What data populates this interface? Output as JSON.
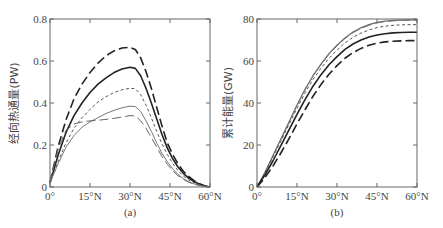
{
  "chart_data": [
    {
      "id": "a",
      "type": "line",
      "caption": "(a)",
      "title": "",
      "xlabel": "",
      "ylabel": "经向热通量(PW)",
      "xlim": [
        0,
        60
      ],
      "ylim": [
        0,
        0.8
      ],
      "xticks": [
        0,
        15,
        30,
        45,
        60
      ],
      "xtick_labels": [
        "0°",
        "15°N",
        "30°N",
        "45°N",
        "60°N"
      ],
      "yticks": [
        0,
        0.2,
        0.4,
        0.6,
        0.8
      ],
      "ytick_labels": [
        "0",
        "0.2",
        "0.4",
        "0.6",
        "0.8"
      ],
      "grid": false,
      "legend": null,
      "x": [
        0,
        3,
        6,
        9,
        12,
        15,
        18,
        21,
        24,
        27,
        30,
        32,
        34,
        36,
        38,
        40,
        42,
        44,
        46,
        48,
        50,
        52,
        54,
        56,
        58,
        60
      ],
      "series": [
        {
          "name": "long-dash (heavy)",
          "style": "long-dash",
          "color": "#222222",
          "width": 1.6,
          "values": [
            0.02,
            0.19,
            0.32,
            0.42,
            0.49,
            0.545,
            0.59,
            0.625,
            0.648,
            0.662,
            0.665,
            0.655,
            0.615,
            0.55,
            0.47,
            0.38,
            0.29,
            0.21,
            0.155,
            0.11,
            0.075,
            0.05,
            0.03,
            0.016,
            0.006,
            0.0
          ]
        },
        {
          "name": "solid (heavy)",
          "style": "solid",
          "color": "#222222",
          "width": 1.6,
          "values": [
            0.02,
            0.15,
            0.26,
            0.34,
            0.4,
            0.45,
            0.49,
            0.52,
            0.545,
            0.562,
            0.57,
            0.565,
            0.53,
            0.47,
            0.4,
            0.325,
            0.25,
            0.185,
            0.135,
            0.095,
            0.065,
            0.042,
            0.026,
            0.014,
            0.005,
            0.0
          ]
        },
        {
          "name": "short-dash",
          "style": "short-dash",
          "color": "#555555",
          "width": 1.0,
          "values": [
            0.02,
            0.12,
            0.21,
            0.28,
            0.33,
            0.37,
            0.405,
            0.43,
            0.45,
            0.463,
            0.47,
            0.468,
            0.44,
            0.39,
            0.33,
            0.265,
            0.205,
            0.155,
            0.112,
            0.078,
            0.052,
            0.034,
            0.02,
            0.011,
            0.004,
            0.0
          ]
        },
        {
          "name": "solid (light)",
          "style": "solid",
          "color": "#777777",
          "width": 1.0,
          "values": [
            0.02,
            0.11,
            0.19,
            0.245,
            0.285,
            0.31,
            0.33,
            0.35,
            0.365,
            0.377,
            0.385,
            0.383,
            0.36,
            0.315,
            0.265,
            0.21,
            0.16,
            0.12,
            0.087,
            0.06,
            0.04,
            0.025,
            0.015,
            0.008,
            0.003,
            0.0
          ]
        },
        {
          "name": "long-dash (light)",
          "style": "long-dash",
          "color": "#666666",
          "width": 1.0,
          "values": [
            0.02,
            0.18,
            0.27,
            0.3,
            0.31,
            0.315,
            0.318,
            0.322,
            0.327,
            0.333,
            0.34,
            0.338,
            0.315,
            0.28,
            0.235,
            0.19,
            0.145,
            0.108,
            0.078,
            0.054,
            0.036,
            0.023,
            0.014,
            0.007,
            0.003,
            0.0
          ]
        }
      ]
    },
    {
      "id": "b",
      "type": "line",
      "caption": "(b)",
      "title": "",
      "xlabel": "",
      "ylabel": "累计能量(GW)",
      "xlim": [
        0,
        60
      ],
      "ylim": [
        0,
        80
      ],
      "xticks": [
        0,
        15,
        30,
        45,
        60
      ],
      "xtick_labels": [
        "0°",
        "15°N",
        "30°N",
        "45°N",
        "60°N"
      ],
      "yticks": [
        0,
        20,
        40,
        60,
        80
      ],
      "ytick_labels": [
        "0",
        "20",
        "40",
        "60",
        "80"
      ],
      "grid": false,
      "legend": null,
      "x": [
        0,
        3,
        6,
        9,
        12,
        15,
        18,
        21,
        24,
        27,
        30,
        33,
        36,
        39,
        42,
        45,
        48,
        51,
        54,
        57,
        60
      ],
      "series": [
        {
          "name": "solid (light)",
          "style": "solid",
          "color": "#666666",
          "width": 1.2,
          "values": [
            0,
            7,
            15,
            23,
            31,
            39,
            46.5,
            53,
            58.5,
            63.5,
            67.5,
            71,
            73.8,
            75.8,
            77.3,
            78.4,
            79.0,
            79.3,
            79.5,
            79.6,
            79.6
          ]
        },
        {
          "name": "long-dash (light)",
          "style": "long-dash",
          "color": "#777777",
          "width": 1.0,
          "values": [
            0,
            7,
            14.8,
            22.8,
            30.8,
            38.7,
            46.2,
            52.8,
            58.3,
            63.2,
            67.2,
            70.7,
            73.5,
            75.5,
            77.0,
            78.1,
            78.8,
            79.1,
            79.3,
            79.4,
            79.4
          ]
        },
        {
          "name": "short-dash",
          "style": "short-dash",
          "color": "#555555",
          "width": 1.0,
          "values": [
            0,
            6.8,
            14.3,
            22,
            29.8,
            37.5,
            44.8,
            51.2,
            56.6,
            61.3,
            65.2,
            68.6,
            71.3,
            73.3,
            74.8,
            75.9,
            76.6,
            77.0,
            77.2,
            77.3,
            77.3
          ]
        },
        {
          "name": "solid (heavy)",
          "style": "solid",
          "color": "#222222",
          "width": 1.6,
          "values": [
            0,
            5.8,
            12.5,
            19.8,
            27.2,
            34.6,
            41.6,
            48,
            53.5,
            58.2,
            62.1,
            65.5,
            68.1,
            70.0,
            71.4,
            72.4,
            73.0,
            73.4,
            73.6,
            73.7,
            73.7
          ]
        },
        {
          "name": "long-dash (heavy)",
          "style": "long-dash",
          "color": "#222222",
          "width": 1.6,
          "values": [
            0,
            4.5,
            10,
            16.3,
            23,
            30,
            36.8,
            43.2,
            48.8,
            53.7,
            57.8,
            61.3,
            64.0,
            66.0,
            67.5,
            68.5,
            69.1,
            69.4,
            69.6,
            69.7,
            69.7
          ]
        }
      ]
    }
  ],
  "panels": {
    "a": {
      "caption": "(a)",
      "ylabel": "经向热通量(PW)"
    },
    "b": {
      "caption": "(b)",
      "ylabel": "累计能量(GW)"
    }
  }
}
